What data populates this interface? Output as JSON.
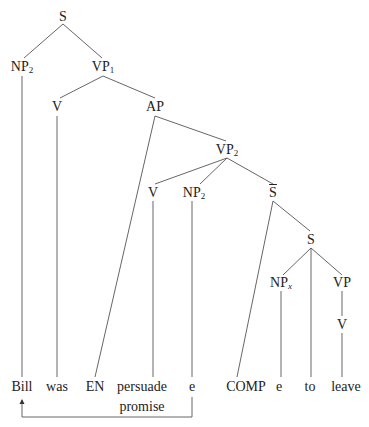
{
  "diagram": {
    "type": "syntax-tree",
    "nodes": [
      {
        "id": "S_root",
        "label": "S",
        "sub": "",
        "x": 63,
        "y": 17
      },
      {
        "id": "NP2_subj",
        "label": "NP",
        "sub": "2",
        "x": 22,
        "y": 67
      },
      {
        "id": "VP1",
        "label": "VP",
        "sub": "1",
        "x": 103,
        "y": 67
      },
      {
        "id": "V_was",
        "label": "V",
        "sub": "",
        "x": 57,
        "y": 107
      },
      {
        "id": "AP",
        "label": "AP",
        "sub": "",
        "x": 155,
        "y": 107
      },
      {
        "id": "VP2",
        "label": "VP",
        "sub": "2",
        "x": 227,
        "y": 150
      },
      {
        "id": "V_persuade",
        "label": "V",
        "sub": "",
        "x": 153,
        "y": 193
      },
      {
        "id": "NP2_obj",
        "label": "NP",
        "sub": "2",
        "x": 194,
        "y": 193
      },
      {
        "id": "Sbar",
        "label": "S",
        "sub": "",
        "bar": true,
        "x": 273,
        "y": 193
      },
      {
        "id": "S_inner",
        "label": "S",
        "sub": "",
        "x": 311,
        "y": 240
      },
      {
        "id": "NPx",
        "label": "NP",
        "sub": "x",
        "x": 281,
        "y": 283
      },
      {
        "id": "VP_inner",
        "label": "VP",
        "sub": "",
        "x": 342,
        "y": 283
      },
      {
        "id": "V_leave",
        "label": "V",
        "sub": "",
        "x": 342,
        "y": 325
      }
    ],
    "leaves": [
      {
        "id": "leaf_bill",
        "label": "Bill",
        "x": 22,
        "y": 387
      },
      {
        "id": "leaf_was",
        "label": "was",
        "x": 57,
        "y": 387
      },
      {
        "id": "leaf_en",
        "label": "EN",
        "x": 95,
        "y": 387
      },
      {
        "id": "leaf_persuade",
        "label": "persuade",
        "x": 142,
        "y": 387
      },
      {
        "id": "leaf_promise",
        "label": "promise",
        "x": 142,
        "y": 407
      },
      {
        "id": "leaf_e1",
        "label": "e",
        "x": 192,
        "y": 387
      },
      {
        "id": "leaf_comp",
        "label": "COMP",
        "x": 246,
        "y": 387
      },
      {
        "id": "leaf_e2",
        "label": "e",
        "x": 279,
        "y": 387
      },
      {
        "id": "leaf_to",
        "label": "to",
        "x": 310,
        "y": 387
      },
      {
        "id": "leaf_leave",
        "label": "leave",
        "x": 346,
        "y": 387
      }
    ],
    "edges": [
      [
        63,
        24,
        24,
        58
      ],
      [
        63,
        24,
        102,
        58
      ],
      [
        22,
        76,
        22,
        377
      ],
      [
        103,
        76,
        60,
        98
      ],
      [
        103,
        76,
        155,
        98
      ],
      [
        57,
        116,
        57,
        377
      ],
      [
        155,
        116,
        95,
        377
      ],
      [
        155,
        116,
        226,
        141
      ],
      [
        227,
        158,
        155,
        184
      ],
      [
        227,
        158,
        200,
        184
      ],
      [
        227,
        158,
        273,
        184
      ],
      [
        153,
        201,
        153,
        377
      ],
      [
        192,
        201,
        192,
        377
      ],
      [
        273,
        201,
        237,
        377
      ],
      [
        273,
        201,
        310,
        231
      ],
      [
        311,
        248,
        283,
        275
      ],
      [
        311,
        248,
        311,
        377
      ],
      [
        311,
        248,
        342,
        275
      ],
      [
        281,
        291,
        281,
        377
      ],
      [
        342,
        291,
        342,
        316
      ],
      [
        342,
        333,
        342,
        377
      ]
    ],
    "arrow": {
      "from": "e",
      "to": "Bill",
      "path": [
        [
          192,
          397
        ],
        [
          192,
          417
        ],
        [
          22,
          417
        ],
        [
          22,
          400
        ]
      ]
    }
  }
}
